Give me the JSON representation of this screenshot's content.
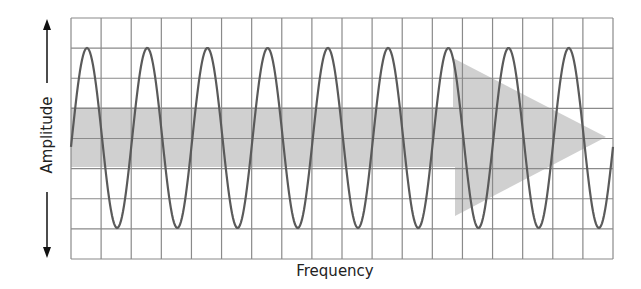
{
  "diagram": {
    "title": "",
    "x_axis_label": "Frequency",
    "y_axis_label": "Amplitude",
    "grid": {
      "columns": 18,
      "rows": 8,
      "color": "#8a8a8a"
    },
    "wave": {
      "type": "sine",
      "cycles": 9,
      "color": "#5a5a5a"
    },
    "arrow": {
      "direction": "right",
      "fill": "#c8c8c8",
      "meaning": "increasing frequency"
    },
    "colors": {
      "background": "#ffffff",
      "text": "#222222",
      "axis_arrow": "#111111"
    }
  }
}
